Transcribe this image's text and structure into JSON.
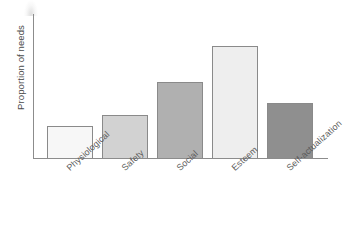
{
  "chart_data": {
    "type": "bar",
    "title": "",
    "subtitle": "",
    "xlabel": "",
    "ylabel": "Proportion of needs",
    "categories": [
      "Physiological",
      "Safety",
      "Social",
      "Esteem",
      "Self-actualization"
    ],
    "values": [
      0.22,
      0.3,
      0.53,
      0.78,
      0.38
    ],
    "ylim": [
      0,
      1
    ],
    "y_tick_labels": [],
    "x_tick_labels": [
      "Physiological",
      "Safety",
      "Social",
      "Esteem",
      "Self-actualization"
    ],
    "grid": false,
    "legend": false,
    "legend_position": "none",
    "annotations": [],
    "bar_colors": [
      "#f7f7f7",
      "#d2d2d2",
      "#b0b0b0",
      "#eeeeee",
      "#8f8f8f"
    ],
    "bar_border_color": "#8a8a8a",
    "axis_color": "#8c8c8c",
    "text_color": "#5a5a5a",
    "background": "#ffffff"
  },
  "axes": {
    "y_title": "Proportion of needs"
  }
}
